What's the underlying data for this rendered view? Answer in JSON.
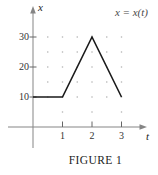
{
  "figure": {
    "kind": "math-plot",
    "caption": "FIGURE 1"
  },
  "chart_data": {
    "type": "line",
    "title": "x = x(t)",
    "caption": "FIGURE 1",
    "xlabel": "t",
    "ylabel": "x",
    "x": [
      0,
      1,
      2,
      3
    ],
    "values": [
      10,
      10,
      30,
      10
    ],
    "x_ticks": [
      1,
      2,
      3
    ],
    "y_ticks": [
      30,
      20,
      10
    ],
    "xlim": [
      0,
      3.4
    ],
    "ylim": [
      0,
      36
    ],
    "grid": "dotted",
    "grid_dots": {
      "full_rows_x": [
        10,
        15,
        20,
        25,
        30
      ],
      "full_cols_t": [
        0.5,
        1,
        1.5,
        2,
        2.5,
        3
      ],
      "sparse_row_x": 5,
      "sparse_cols_t": [
        1,
        2,
        3
      ]
    },
    "line_color": "#1a1a1a",
    "axis_color": "#858585",
    "tick_color": "#666666",
    "dot_color": "#b3b3b3",
    "legend": "none"
  }
}
